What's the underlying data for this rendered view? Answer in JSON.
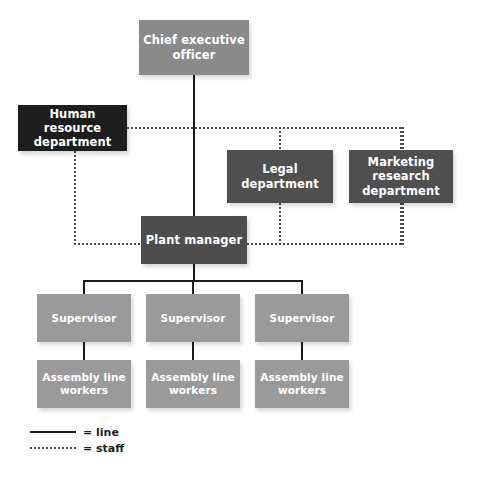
{
  "chart_data": {
    "type": "diagram",
    "diagram_type": "organizational-chart",
    "title": "",
    "nodes": [
      {
        "id": "ceo",
        "label": "Chief executive officer",
        "lines": [
          "Chief executive",
          "officer"
        ],
        "relation": "line",
        "level": 0,
        "color": "#8a8a8a",
        "text_color": "#ffffff",
        "x": 139,
        "y": 20,
        "w": 110,
        "h": 55
      },
      {
        "id": "hr",
        "label": "Human resource department",
        "lines": [
          "Human resource",
          "department"
        ],
        "relation": "staff",
        "level": 1,
        "color": "#1d1d1d",
        "text_color": "#ffffff",
        "x": 18,
        "y": 105,
        "w": 109,
        "h": 46
      },
      {
        "id": "legal",
        "label": "Legal department",
        "lines": [
          "Legal",
          "department"
        ],
        "relation": "staff",
        "level": 1,
        "color": "#4f4f4f",
        "text_color": "#ffffff",
        "x": 227,
        "y": 150,
        "w": 106,
        "h": 53
      },
      {
        "id": "mktg",
        "label": "Marketing research department",
        "lines": [
          "Marketing",
          "research",
          "department"
        ],
        "relation": "staff",
        "level": 1,
        "color": "#4f4f4f",
        "text_color": "#ffffff",
        "x": 349,
        "y": 150,
        "w": 104,
        "h": 53
      },
      {
        "id": "plant",
        "label": "Plant manager",
        "lines": [
          "Plant manager"
        ],
        "relation": "line",
        "level": 2,
        "color": "#4d4d4d",
        "text_color": "#ffffff",
        "x": 141,
        "y": 216,
        "w": 106,
        "h": 48
      },
      {
        "id": "sup1",
        "label": "Supervisor",
        "lines": [
          "Supervisor"
        ],
        "relation": "line",
        "level": 3,
        "color": "#9a9a9a",
        "text_color": "#ffffff",
        "x": 37,
        "y": 294,
        "w": 94,
        "h": 48
      },
      {
        "id": "sup2",
        "label": "Supervisor",
        "lines": [
          "Supervisor"
        ],
        "relation": "line",
        "level": 3,
        "color": "#9a9a9a",
        "text_color": "#ffffff",
        "x": 146,
        "y": 294,
        "w": 94,
        "h": 48
      },
      {
        "id": "sup3",
        "label": "Supervisor",
        "lines": [
          "Supervisor"
        ],
        "relation": "line",
        "level": 3,
        "color": "#9a9a9a",
        "text_color": "#ffffff",
        "x": 255,
        "y": 294,
        "w": 94,
        "h": 48
      },
      {
        "id": "work1",
        "label": "Assembly line workers",
        "lines": [
          "Assembly line",
          "workers"
        ],
        "relation": "line",
        "level": 4,
        "color": "#9a9a9a",
        "text_color": "#ffffff",
        "x": 37,
        "y": 360,
        "w": 94,
        "h": 48
      },
      {
        "id": "work2",
        "label": "Assembly line workers",
        "lines": [
          "Assembly line",
          "workers"
        ],
        "relation": "line",
        "level": 4,
        "color": "#9a9a9a",
        "text_color": "#ffffff",
        "x": 146,
        "y": 360,
        "w": 94,
        "h": 48
      },
      {
        "id": "work3",
        "label": "Assembly line workers",
        "lines": [
          "Assembly line",
          "workers"
        ],
        "relation": "line",
        "level": 4,
        "color": "#9a9a9a",
        "text_color": "#ffffff",
        "x": 255,
        "y": 360,
        "w": 94,
        "h": 48
      }
    ],
    "edges": [
      {
        "from": "ceo",
        "to": "plant",
        "relation": "line"
      },
      {
        "from": "plant",
        "to": "sup1",
        "relation": "line"
      },
      {
        "from": "plant",
        "to": "sup2",
        "relation": "line"
      },
      {
        "from": "plant",
        "to": "sup3",
        "relation": "line"
      },
      {
        "from": "sup1",
        "to": "work1",
        "relation": "line"
      },
      {
        "from": "sup2",
        "to": "work2",
        "relation": "line"
      },
      {
        "from": "sup3",
        "to": "work3",
        "relation": "line"
      },
      {
        "from": "hr",
        "to": "ceo",
        "relation": "staff"
      },
      {
        "from": "hr",
        "to": "plant",
        "relation": "staff"
      },
      {
        "from": "legal",
        "to": "ceo",
        "relation": "staff"
      },
      {
        "from": "legal",
        "to": "plant",
        "relation": "staff"
      },
      {
        "from": "mktg",
        "to": "ceo",
        "relation": "staff"
      },
      {
        "from": "mktg",
        "to": "plant",
        "relation": "staff"
      }
    ],
    "colors": {
      "background": "#ffffff",
      "line_color": "#1b1b1b",
      "staff_line_color": "#4a4a4a",
      "exec_box": "#8a8a8a",
      "staff_box": "#1d1d1d",
      "dept_box": "#4f4f4f",
      "plant_box": "#4d4d4d",
      "supervisor_box": "#9a9a9a",
      "worker_box": "#9a9a9a",
      "node_text": "#ffffff"
    }
  },
  "legend": {
    "items": [
      {
        "style": "solid",
        "label": "= line"
      },
      {
        "style": "dotted",
        "label": "= staff"
      }
    ]
  }
}
